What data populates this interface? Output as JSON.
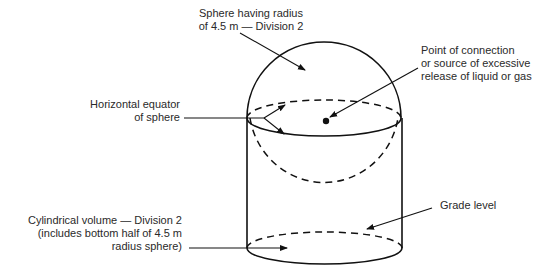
{
  "labels": {
    "sphere": {
      "line1": "Sphere having radius",
      "line2": "of 4.5 m — Division 2"
    },
    "source": {
      "line1": "Point of connection",
      "line2": "or source of excessive",
      "line3": "release of liquid or gas"
    },
    "equator": {
      "line1": "Horizontal equator",
      "line2": "of sphere"
    },
    "cylinder": {
      "line1": "Cylindrical volume — Division 2",
      "line2": "(includes bottom half of 4.5 m",
      "line3": "radius sphere)"
    },
    "grade": {
      "line1": "Grade level"
    }
  },
  "colors": {
    "stroke": "#111111",
    "background": "#ffffff",
    "text": "#2a2a2a"
  }
}
